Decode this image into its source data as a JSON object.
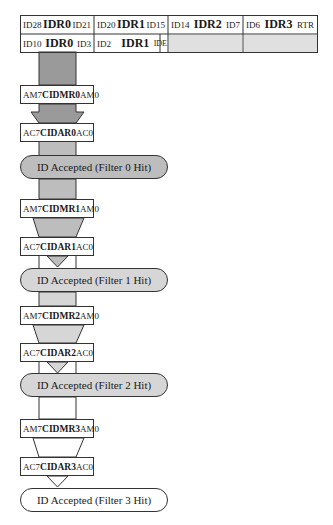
{
  "id_table": {
    "row1": [
      {
        "lo": "ID28",
        "reg": "IDR0",
        "hi": "ID21"
      },
      {
        "lo": "ID20",
        "reg": "IDR1",
        "hi": "ID15"
      },
      {
        "lo": "ID14",
        "reg": "IDR2",
        "hi": "ID7"
      },
      {
        "lo": "ID6",
        "reg": "IDR3",
        "hi": "RTR"
      }
    ],
    "row2": [
      {
        "lo": "ID10",
        "reg": "IDR0",
        "hi": "ID3"
      },
      {
        "lo": "ID2",
        "reg": "IDR1",
        "hi": "IDE"
      }
    ]
  },
  "filters": [
    {
      "mask": {
        "left": "AM7",
        "name": "CIDMR0",
        "right": "AM0"
      },
      "accept": {
        "left": "AC7",
        "name": "CIDAR0",
        "right": "AC0"
      },
      "result": "ID Accepted (Filter 0 Hit)"
    },
    {
      "mask": {
        "left": "AM7",
        "name": "CIDMR1",
        "right": "AM0"
      },
      "accept": {
        "left": "AC7",
        "name": "CIDAR1",
        "right": "AC0"
      },
      "result": "ID Accepted (Filter 1 Hit)"
    },
    {
      "mask": {
        "left": "AM7",
        "name": "CIDMR2",
        "right": "AM0"
      },
      "accept": {
        "left": "AC7",
        "name": "CIDAR2",
        "right": "AC0"
      },
      "result": "ID Accepted (Filter 2 Hit)"
    },
    {
      "mask": {
        "left": "AM7",
        "name": "CIDMR3",
        "right": "AM0"
      },
      "accept": {
        "left": "AC7",
        "name": "CIDAR3",
        "right": "AC0"
      },
      "result": "ID Accepted (Filter 3 Hit)"
    }
  ],
  "colors": {
    "stage0": "#9a9a9a",
    "stage1": "#bdbdbd",
    "stage2": "#d6d6d6",
    "stage3": "#ffffff",
    "empty_cell": "#e0e0e0",
    "border": "#333333"
  }
}
